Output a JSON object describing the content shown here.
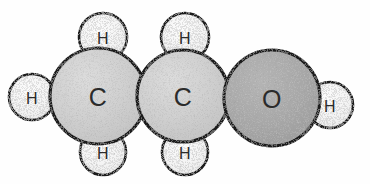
{
  "diagram": {
    "formula": "C2H5OH",
    "background_color": "#fefefe",
    "outline_color": "#1a1a1a",
    "label_color": "#2b2b2b"
  },
  "palette": {
    "carbon_fill": "#c9c9c9",
    "carbon_fill_light": "#d6d6d6",
    "oxygen_fill": "#a3a3a3",
    "oxygen_fill_light": "#b0b0b0",
    "hydrogen_fill": "#f2f2f2",
    "hydrogen_fill_light": "#fbfbfb",
    "outline": "#1a1a1a",
    "text": "#2b2b2b"
  },
  "atoms": [
    {
      "id": "h-left",
      "element": "H",
      "label": "H",
      "cx": 32,
      "cy": 97,
      "r": 23,
      "kind": "hydrogen",
      "label_size": "light"
    },
    {
      "id": "carbon-1",
      "element": "C",
      "label": "C",
      "cx": 98,
      "cy": 96,
      "r": 48,
      "kind": "carbon",
      "label_size": "heavy"
    },
    {
      "id": "h-top-left",
      "element": "H",
      "label": "H",
      "cx": 103,
      "cy": 37,
      "r": 24,
      "kind": "hydrogen",
      "label_size": "light"
    },
    {
      "id": "h-bottom-left",
      "element": "H",
      "label": "H",
      "cx": 103,
      "cy": 152,
      "r": 23,
      "kind": "hydrogen",
      "label_size": "light"
    },
    {
      "id": "carbon-2",
      "element": "C",
      "label": "C",
      "cx": 183,
      "cy": 96,
      "r": 46,
      "kind": "carbon",
      "label_size": "heavy"
    },
    {
      "id": "h-top-middle",
      "element": "H",
      "label": "H",
      "cx": 185,
      "cy": 37,
      "r": 24,
      "kind": "hydrogen",
      "label_size": "light"
    },
    {
      "id": "h-bottom-middle",
      "element": "H",
      "label": "H",
      "cx": 185,
      "cy": 152,
      "r": 23,
      "kind": "hydrogen",
      "label_size": "light"
    },
    {
      "id": "oxygen",
      "element": "O",
      "label": "O",
      "cx": 272,
      "cy": 98,
      "r": 48,
      "kind": "oxygen",
      "label_size": "heavy"
    },
    {
      "id": "h-right",
      "element": "H",
      "label": "H",
      "cx": 330,
      "cy": 105,
      "r": 23,
      "kind": "hydrogen",
      "label_size": "light"
    }
  ]
}
